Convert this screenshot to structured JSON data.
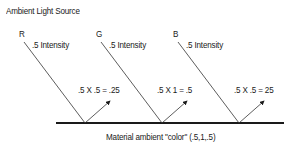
{
  "title": "Ambient Light Source",
  "channels": [
    {
      "name": "R",
      "intensity_label": ".5 Intensity",
      "result_label": ".5 X .5 = .25"
    },
    {
      "name": "G",
      "intensity_label": ".5 Intensity",
      "result_label": ".5 X 1 = .5"
    },
    {
      "name": "B",
      "intensity_label": ".5 Intensity",
      "result_label": ".5 X .5 = 25"
    }
  ],
  "material_label": "Material ambient \"color\" (.5,1,.5)",
  "colors": {
    "line": "#1a1a1a",
    "background": "#ffffff"
  }
}
